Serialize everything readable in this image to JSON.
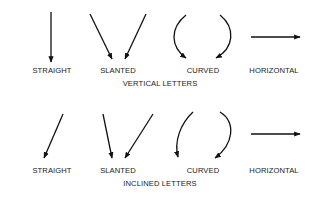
{
  "diagram": {
    "rows": [
      {
        "caption": "VERTICAL LETTERS",
        "items": [
          {
            "label": "STRAIGHT",
            "stroke": "straight-down"
          },
          {
            "label": "SLANTED",
            "stroke": "two-slants-converging"
          },
          {
            "label": "CURVED",
            "stroke": "two-curves-converging"
          },
          {
            "label": "HORIZONTAL",
            "stroke": "left-to-right"
          }
        ]
      },
      {
        "caption": "INCLINED LETTERS",
        "items": [
          {
            "label": "STRAIGHT",
            "stroke": "inclined-down-left"
          },
          {
            "label": "SLANTED",
            "stroke": "two-slants-converging"
          },
          {
            "label": "CURVED",
            "stroke": "two-curves-converging-inclined"
          },
          {
            "label": "HORIZONTAL",
            "stroke": "left-to-right"
          }
        ]
      }
    ],
    "stroke_color": "#111111"
  }
}
